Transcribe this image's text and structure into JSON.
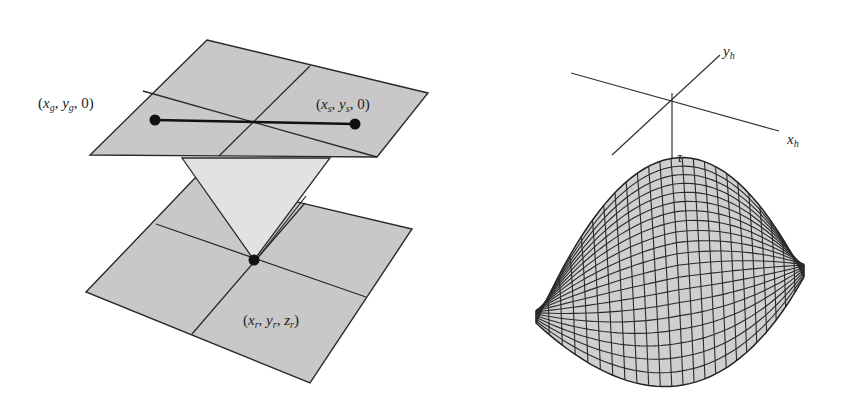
{
  "left_panel": {
    "description": "Source-receiver geometry: surface plane with source and geophone, diffraction point on a subsurface plane",
    "labels": {
      "geophone": {
        "main": [
          "x",
          "y",
          "0"
        ],
        "subs": [
          "g",
          "g",
          ""
        ],
        "text": "(x_g, y_g, 0)"
      },
      "source": {
        "main": [
          "x",
          "y",
          "0"
        ],
        "subs": [
          "s",
          "s",
          ""
        ],
        "text": "(x_s, y_s, 0)"
      },
      "receiver": {
        "main": [
          "x",
          "y",
          "z"
        ],
        "subs": [
          "r",
          "r",
          "r"
        ],
        "text": "(x_r, y_r, z_r)"
      }
    }
  },
  "right_panel": {
    "description": "Diffraction traveltime surface (hyperboloid) with midpoint axes",
    "labels": {
      "axis_y": {
        "main": "y",
        "sub": "h"
      },
      "axis_x": {
        "main": "x",
        "sub": "h"
      },
      "apex": "τ"
    },
    "grid": {
      "rows": 20,
      "cols": 24
    }
  },
  "colors": {
    "plane_fill": "#c8c8c8",
    "cone_fill": "#e2e2e2",
    "stroke": "#2a2a2a",
    "surface_fill": "#cfcfcf"
  }
}
